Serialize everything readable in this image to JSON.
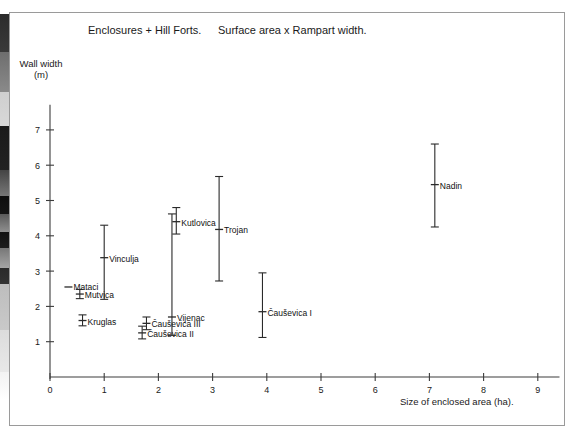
{
  "figure": {
    "title_left": "Enclosures + Hill Forts.",
    "title_right": "Surface area x Rampart width.",
    "y_axis_label": "Wall width\n(m)",
    "x_axis_label": "Size of enclosed area (ha)."
  },
  "chart_data": {
    "type": "scatter",
    "title": "Enclosures + Hill Forts.    Surface area x Rampart width.",
    "xlabel": "Size of enclosed area (ha).",
    "ylabel": "Wall width (m)",
    "xlim": [
      0,
      9.4
    ],
    "ylim": [
      0,
      7.6
    ],
    "xticks": [
      0,
      1,
      2,
      3,
      4,
      5,
      6,
      7,
      8,
      9
    ],
    "xticklabels": [
      "0",
      "1",
      "2",
      "3",
      "4",
      "5",
      "6",
      "7",
      "8",
      "9"
    ],
    "yticks": [
      1,
      2,
      3,
      4,
      5,
      6,
      7
    ],
    "yticklabels": [
      "1",
      "2",
      "3",
      "4",
      "5",
      "6",
      "7"
    ],
    "grid": false,
    "legend": false,
    "error_orientation": "vertical",
    "points": [
      {
        "label": "Mataci",
        "x": 0.34,
        "y": 2.55,
        "low": 2.55,
        "high": 2.55,
        "label_dx": 5,
        "label_dy": 3
      },
      {
        "label": "Mutvica",
        "x": 0.55,
        "y": 2.35,
        "low": 2.22,
        "high": 2.48,
        "label_dx": 5,
        "label_dy": 4
      },
      {
        "label": "Kruglas",
        "x": 0.6,
        "y": 1.6,
        "low": 1.45,
        "high": 1.76,
        "label_dx": 5,
        "label_dy": 4
      },
      {
        "label": "Vinculja",
        "x": 1.0,
        "y": 3.38,
        "low": 2.2,
        "high": 4.3,
        "label_dx": 5,
        "label_dy": 4
      },
      {
        "label": "Čauševica II",
        "x": 1.7,
        "y": 1.25,
        "low": 1.08,
        "high": 1.44,
        "label_dx": 5,
        "label_dy": 4
      },
      {
        "label": "Čauševica III",
        "x": 1.78,
        "y": 1.52,
        "low": 1.34,
        "high": 1.7,
        "label_dx": 5,
        "label_dy": 4
      },
      {
        "label": "Vijenac",
        "x": 2.25,
        "y": 1.7,
        "low": 1.18,
        "high": 4.62,
        "label_dx": 5,
        "label_dy": 4
      },
      {
        "label": "Kutlovica",
        "x": 2.33,
        "y": 4.4,
        "low": 4.05,
        "high": 4.8,
        "label_dx": 5,
        "label_dy": 4
      },
      {
        "label": "Trojan",
        "x": 3.12,
        "y": 4.18,
        "low": 2.72,
        "high": 5.68,
        "label_dx": 5,
        "label_dy": 4
      },
      {
        "label": "Čauševica I",
        "x": 3.92,
        "y": 1.85,
        "low": 1.12,
        "high": 2.95,
        "label_dx": 5,
        "label_dy": 4
      },
      {
        "label": "Nadin",
        "x": 7.1,
        "y": 5.45,
        "low": 4.25,
        "high": 6.6,
        "label_dx": 5,
        "label_dy": 4
      }
    ]
  },
  "geometry": {
    "origin_x": 50,
    "origin_y": 377,
    "x_unit_px": 54.2,
    "y_unit_px": 35.3
  }
}
